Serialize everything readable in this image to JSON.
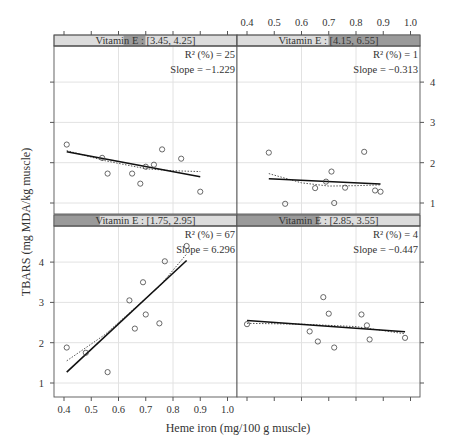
{
  "chart_data": {
    "type": "scatter",
    "title": "",
    "xlabel": "Heme iron (mg/100 g muscle)",
    "ylabel": "TBARS (mg MDA/kg muscle)",
    "xlim": [
      0.36,
      1.05
    ],
    "ylim": [
      0.65,
      4.8
    ],
    "x_ticks": [
      "0.4",
      "0.5",
      "0.6",
      "0.7",
      "0.8",
      "0.9",
      "1.0"
    ],
    "y_ticks": [
      "1",
      "2",
      "3",
      "4"
    ],
    "grid": true,
    "layout": "2x2 trellis, conditioned on Vitamin E",
    "panels": [
      {
        "position": "top-left",
        "strip_label": "Vitamin E : [3.45, 4.25]",
        "strip_shade": [
          0.38,
          0.5
        ],
        "r2_label": "R² (%) = 25",
        "slope_label": "Slope = −1.229",
        "points": [
          [
            0.41,
            2.45
          ],
          [
            0.54,
            2.12
          ],
          [
            0.56,
            1.73
          ],
          [
            0.65,
            1.73
          ],
          [
            0.68,
            1.48
          ],
          [
            0.7,
            1.9
          ],
          [
            0.73,
            1.95
          ],
          [
            0.76,
            2.33
          ],
          [
            0.83,
            2.1
          ],
          [
            0.9,
            1.28
          ]
        ],
        "fit_line": [
          [
            0.41,
            2.27
          ],
          [
            0.9,
            1.65
          ]
        ],
        "smooth_line": [
          [
            0.41,
            2.3
          ],
          [
            0.55,
            2.05
          ],
          [
            0.7,
            1.85
          ],
          [
            0.8,
            1.8
          ],
          [
            0.9,
            1.78
          ]
        ]
      },
      {
        "position": "top-right",
        "strip_label": "Vitamin E : [4.15, 6.55]",
        "strip_shade": [
          0.5,
          1.0
        ],
        "r2_label": "R² (%) = 1",
        "slope_label": "Slope = −0.313",
        "points": [
          [
            0.48,
            2.25
          ],
          [
            0.54,
            0.98
          ],
          [
            0.65,
            1.37
          ],
          [
            0.69,
            1.53
          ],
          [
            0.71,
            1.78
          ],
          [
            0.72,
            1.0
          ],
          [
            0.76,
            1.38
          ],
          [
            0.83,
            2.27
          ],
          [
            0.87,
            1.31
          ],
          [
            0.89,
            1.28
          ]
        ],
        "fit_line": [
          [
            0.48,
            1.6
          ],
          [
            0.89,
            1.47
          ]
        ],
        "smooth_line": [
          [
            0.48,
            1.73
          ],
          [
            0.6,
            1.5
          ],
          [
            0.7,
            1.42
          ],
          [
            0.8,
            1.43
          ],
          [
            0.89,
            1.45
          ]
        ]
      },
      {
        "position": "bottom-left",
        "strip_label": "Vitamin E : [1.75, 2.95]",
        "strip_shade": [
          0.0,
          0.25
        ],
        "r2_label": "R² (%) = 67",
        "slope_label": "Slope = 6.296",
        "points": [
          [
            0.41,
            1.88
          ],
          [
            0.48,
            1.75
          ],
          [
            0.56,
            1.27
          ],
          [
            0.64,
            3.05
          ],
          [
            0.66,
            2.35
          ],
          [
            0.69,
            3.5
          ],
          [
            0.7,
            2.7
          ],
          [
            0.75,
            2.48
          ],
          [
            0.77,
            4.02
          ],
          [
            0.85,
            4.4
          ]
        ],
        "fit_line": [
          [
            0.41,
            1.27
          ],
          [
            0.85,
            4.04
          ]
        ],
        "smooth_line": [
          [
            0.41,
            1.55
          ],
          [
            0.55,
            2.2
          ],
          [
            0.65,
            2.8
          ],
          [
            0.75,
            3.4
          ],
          [
            0.85,
            4.2
          ]
        ]
      },
      {
        "position": "bottom-right",
        "strip_label": "Vitamin E : [2.85, 3.55]",
        "strip_shade": [
          0.0,
          0.45
        ],
        "r2_label": "R² (%) = 4",
        "slope_label": "Slope = −0.447",
        "points": [
          [
            0.4,
            2.46
          ],
          [
            0.63,
            2.28
          ],
          [
            0.66,
            2.03
          ],
          [
            0.68,
            3.13
          ],
          [
            0.7,
            2.72
          ],
          [
            0.72,
            1.88
          ],
          [
            0.82,
            2.7
          ],
          [
            0.84,
            2.43
          ],
          [
            0.85,
            2.08
          ],
          [
            0.98,
            2.12
          ]
        ],
        "fit_line": [
          [
            0.4,
            2.55
          ],
          [
            0.98,
            2.27
          ]
        ],
        "smooth_line": [
          [
            0.4,
            2.48
          ],
          [
            0.6,
            2.46
          ],
          [
            0.8,
            2.4
          ],
          [
            0.98,
            2.22
          ]
        ]
      }
    ]
  }
}
